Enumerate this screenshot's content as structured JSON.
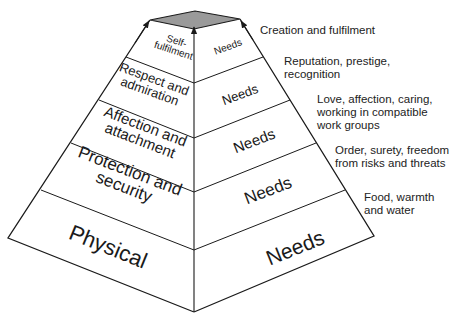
{
  "diagram": {
    "type": "pyramid",
    "levels": [
      {
        "left_label_line1": "Physical",
        "left_label_line2": "",
        "right_label": "Needs",
        "description_line1": "Food, warmth",
        "description_line2": "and water",
        "description_line3": ""
      },
      {
        "left_label_line1": "Protection and",
        "left_label_line2": "security",
        "right_label": "Needs",
        "description_line1": "Order, surety, freedom",
        "description_line2": "from risks and threats",
        "description_line3": ""
      },
      {
        "left_label_line1": "Affection and",
        "left_label_line2": "attachment",
        "right_label": "Needs",
        "description_line1": "Love, affection, caring,",
        "description_line2": "working in compatible",
        "description_line3": "work groups"
      },
      {
        "left_label_line1": "Respect and",
        "left_label_line2": "admiration",
        "right_label": "Needs",
        "description_line1": "Reputation, prestige,",
        "description_line2": "recognition",
        "description_line3": ""
      },
      {
        "left_label_line1": "Self-",
        "left_label_line2": "fulfilment",
        "right_label": "Needs",
        "description_line1": "Creation and fulfilment",
        "description_line2": "",
        "description_line3": ""
      }
    ],
    "colors": {
      "line": "#1a1a1a",
      "top_face": "#9a9a9a",
      "background": "#ffffff"
    }
  }
}
